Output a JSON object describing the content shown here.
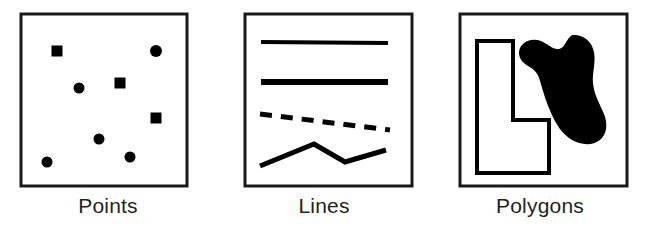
{
  "figure": {
    "background_color": "#ffffff",
    "ink_color": "#000000",
    "label_color": "#231f20",
    "panel_count": 3
  },
  "panels": [
    {
      "id": "points-panel",
      "label": "Points",
      "box": {
        "x": 21,
        "y": 14,
        "width": 166,
        "height": 172,
        "stroke_width": 3
      },
      "geometry_type": "point",
      "marker_counts": {
        "circle": 5,
        "square": 3,
        "total": 8
      },
      "markers": [
        {
          "name": "square-marker-1",
          "shape": "square",
          "cx": 57,
          "cy": 51,
          "size": 11
        },
        {
          "name": "circle-marker-1",
          "shape": "circle",
          "cx": 156,
          "cy": 51,
          "size": 12
        },
        {
          "name": "circle-marker-2",
          "shape": "circle",
          "cx": 79,
          "cy": 88,
          "size": 11
        },
        {
          "name": "square-marker-2",
          "shape": "square",
          "cx": 120,
          "cy": 83,
          "size": 11
        },
        {
          "name": "square-marker-3",
          "shape": "square",
          "cx": 156,
          "cy": 118,
          "size": 11
        },
        {
          "name": "circle-marker-3",
          "shape": "circle",
          "cx": 99,
          "cy": 139,
          "size": 11
        },
        {
          "name": "circle-marker-4",
          "shape": "circle",
          "cx": 130,
          "cy": 157,
          "size": 11
        },
        {
          "name": "circle-marker-5",
          "shape": "circle",
          "cx": 47,
          "cy": 162,
          "size": 11
        }
      ]
    },
    {
      "id": "lines-panel",
      "label": "Lines",
      "box": {
        "x": 245,
        "y": 14,
        "width": 167,
        "height": 172,
        "stroke_width": 3
      },
      "geometry_type": "line",
      "line_count": 4,
      "lines": [
        {
          "name": "solid-line-thin",
          "style": "solid",
          "stroke_width": 4,
          "points": "261,42 388,43"
        },
        {
          "name": "solid-line-thick",
          "style": "solid",
          "stroke_width": 6,
          "points": "261,82 388,82"
        },
        {
          "name": "dashed-line",
          "style": "dashed",
          "stroke_width": 5,
          "dash_pattern": "12 9",
          "dash_count": 7,
          "points": "260,114 390,130"
        },
        {
          "name": "zigzag-polyline",
          "style": "solid",
          "stroke_width": 5,
          "points": "260,166 314,144 345,162 386,150"
        }
      ]
    },
    {
      "id": "polygons-panel",
      "label": "Polygons",
      "box": {
        "x": 460,
        "y": 14,
        "width": 167,
        "height": 172,
        "stroke_width": 3
      },
      "geometry_type": "polygon",
      "polygon_count": 2,
      "polygons": [
        {
          "name": "l-shaped-polygon",
          "fill": "none",
          "stroke": "#000000",
          "stroke_width": 4,
          "points": "477,41 513,41 513,120 549,120 549,173 477,173"
        },
        {
          "name": "irregular-blob-polygon",
          "fill": "#000000",
          "stroke": "none",
          "path": "M 572 35 C 583 34 592 41 594 52 C 596 63 592 73 593 83 C 594 95 600 104 604 114 C 608 124 607 134 600 140 C 592 146 581 145 572 140 C 562 134 556 124 551 113 C 546 102 543 91 540 81 C 538 73 534 69 528 66 C 521 62 517 55 520 48 C 524 40 533 38 541 41 C 548 44 553 50 559 49 C 565 48 566 39 572 35 Z"
        }
      ]
    }
  ]
}
